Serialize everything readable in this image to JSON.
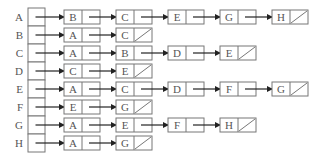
{
  "diagram": {
    "type": "adjacency-list",
    "colors": {
      "stroke": "#777777",
      "arrow": "#222222",
      "text": "#555555"
    },
    "rows": [
      {
        "vertex": "A",
        "adjacent": [
          "B",
          "C",
          "E",
          "G",
          "H"
        ]
      },
      {
        "vertex": "B",
        "adjacent": [
          "A",
          "C"
        ]
      },
      {
        "vertex": "C",
        "adjacent": [
          "A",
          "B",
          "D",
          "E"
        ]
      },
      {
        "vertex": "D",
        "adjacent": [
          "C",
          "E"
        ]
      },
      {
        "vertex": "E",
        "adjacent": [
          "A",
          "C",
          "D",
          "F",
          "G"
        ]
      },
      {
        "vertex": "F",
        "adjacent": [
          "E",
          "G"
        ]
      },
      {
        "vertex": "G",
        "adjacent": [
          "A",
          "E",
          "F",
          "H"
        ]
      },
      {
        "vertex": "H",
        "adjacent": [
          "A",
          "G"
        ]
      }
    ]
  }
}
